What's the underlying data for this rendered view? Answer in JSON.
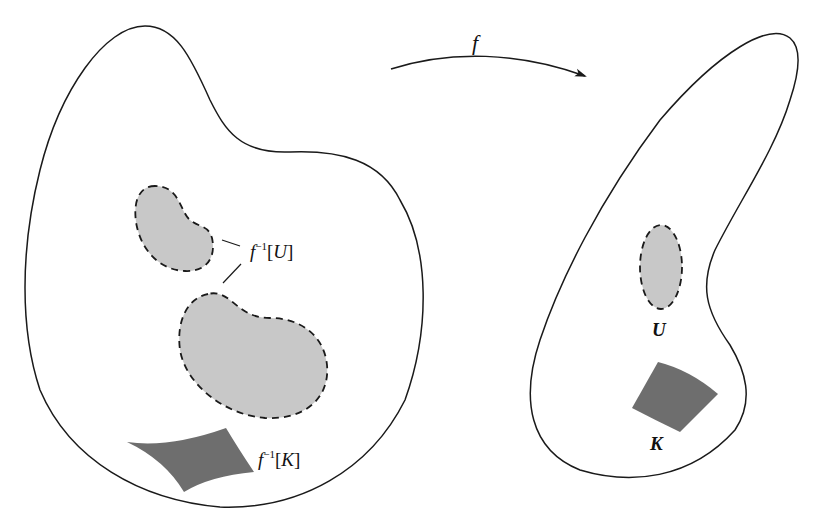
{
  "figure": {
    "map_label": "f",
    "domain_space": {
      "preimage_open_label": "f⁻¹[U]",
      "preimage_open_parts": {
        "f": "f",
        "sup": "−1",
        "open": "[",
        "set": "U",
        "close": "]"
      },
      "preimage_compact_label": "f⁻¹[K]",
      "preimage_compact_parts": {
        "f": "f",
        "sup": "−1",
        "open": "[",
        "set": "K",
        "close": "]"
      }
    },
    "codomain_space": {
      "open_set_label": "U",
      "compact_set_label": "K"
    },
    "colors": {
      "outline": "#1a1a1a",
      "open_fill": "#c8c8c8",
      "compact_fill": "#6e6e6e",
      "background": "#ffffff"
    }
  }
}
